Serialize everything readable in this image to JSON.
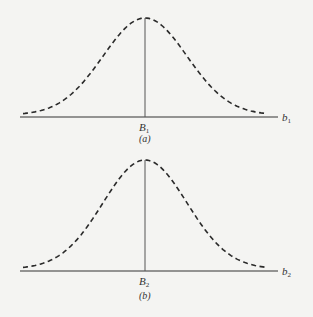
{
  "figures": [
    {
      "id": "a",
      "center_label": "B",
      "center_subscript": "1",
      "axis_label": "b",
      "axis_subscript": "1",
      "caption": "(a)",
      "curve": "bell-shaped density, dashed",
      "marker": "vertical line at center"
    },
    {
      "id": "b",
      "center_label": "B",
      "center_subscript": "2",
      "axis_label": "b",
      "axis_subscript": "2",
      "caption": "(b)",
      "curve": "bell-shaped density, dashed",
      "marker": "vertical line at center"
    }
  ]
}
